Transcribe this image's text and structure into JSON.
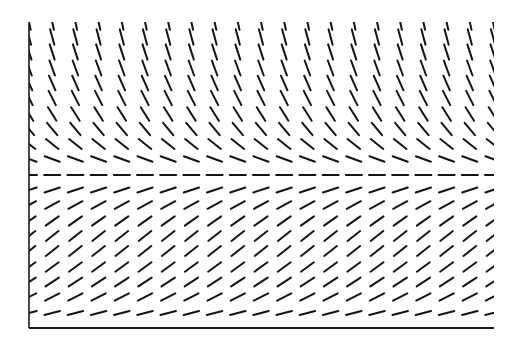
{
  "diagram": {
    "type": "slope-field",
    "title": "",
    "colors": {
      "background": "#ffffff",
      "segments": "#141414",
      "axes": "#1a1a1a"
    },
    "plot_area": {
      "left": 29,
      "right": 494,
      "top": 22,
      "bottom": 328
    },
    "axes": {
      "y_axis": {
        "x": 29,
        "y1": 22,
        "y2": 328
      },
      "x_axis": {
        "y": 328,
        "x1": 29,
        "x2": 494
      },
      "labels": []
    },
    "segment_length": 16,
    "segment_width": 2,
    "columns_x": [
      29,
      52.2,
      75.4,
      98.6,
      121.8,
      145,
      168.2,
      191.4,
      214.6,
      237.8,
      261,
      284.2,
      307.4,
      330.6,
      353.8,
      377,
      400.2,
      423.4,
      446.6,
      469.8,
      493
    ],
    "rows": [
      {
        "y": 22,
        "angle_deg": -78
      },
      {
        "y": 37,
        "angle_deg": -75
      },
      {
        "y": 52,
        "angle_deg": -72
      },
      {
        "y": 68,
        "angle_deg": -70
      },
      {
        "y": 83,
        "angle_deg": -66
      },
      {
        "y": 98,
        "angle_deg": -63
      },
      {
        "y": 114,
        "angle_deg": -58
      },
      {
        "y": 129,
        "angle_deg": -50
      },
      {
        "y": 144,
        "angle_deg": -38
      },
      {
        "y": 159,
        "angle_deg": -20
      },
      {
        "y": 175,
        "angle_deg": 0,
        "equilibrium": true
      },
      {
        "y": 190,
        "angle_deg": 18
      },
      {
        "y": 205,
        "angle_deg": 28
      },
      {
        "y": 221,
        "angle_deg": 35
      },
      {
        "y": 236,
        "angle_deg": 38
      },
      {
        "y": 251,
        "angle_deg": 38
      },
      {
        "y": 267,
        "angle_deg": 36
      },
      {
        "y": 282,
        "angle_deg": 33
      },
      {
        "y": 297,
        "angle_deg": 27
      },
      {
        "y": 313,
        "angle_deg": 15
      }
    ]
  }
}
